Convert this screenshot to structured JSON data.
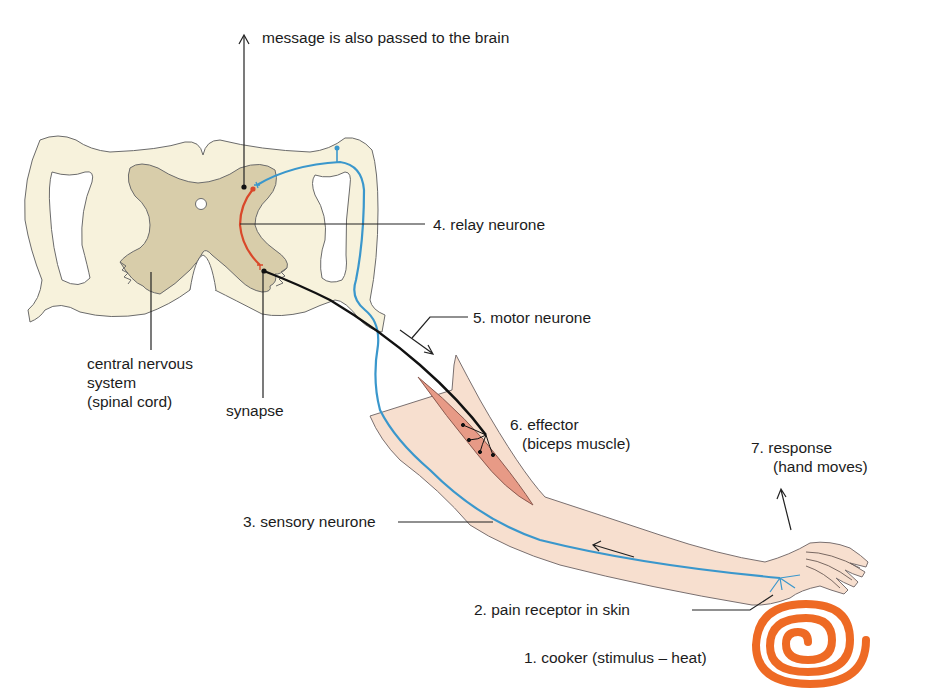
{
  "diagram": {
    "labels": {
      "brain_message": "message is also passed to the brain",
      "relay_neurone": "4. relay neurone",
      "motor_neurone": "5. motor neurone",
      "cns_line1": "central nervous",
      "cns_line2": "system",
      "cns_line3": "(spinal cord)",
      "synapse": "synapse",
      "effector_line1": "6. effector",
      "effector_line2": "(biceps muscle)",
      "response_line1": "7. response",
      "response_line2": "(hand moves)",
      "sensory_neurone": "3. sensory neurone",
      "pain_receptor": "2. pain receptor in skin",
      "stimulus": "1. cooker (stimulus –  heat)"
    },
    "colors": {
      "white_matter": "#f7f2dc",
      "grey_matter": "#d8cdaa",
      "outline": "#6b6b6b",
      "sensory_neurone": "#3a97cc",
      "relay_neurone": "#d9482a",
      "motor_neurone": "#111111",
      "skin": "#f7dfcf",
      "muscle": "#e79a86",
      "cooker": "#ee6a24"
    }
  }
}
